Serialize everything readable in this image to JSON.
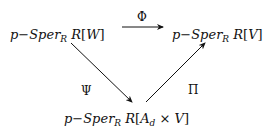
{
  "diagram": {
    "type": "commutative-diagram",
    "nodes": {
      "top_left": {
        "prefix": "p−Sper",
        "sub": "R",
        "ring": "R",
        "open": "[",
        "var": "W",
        "close": "]"
      },
      "top_right": {
        "prefix": "p−Sper",
        "sub": "R",
        "ring": "R",
        "open": "[",
        "var": "V",
        "close": "]"
      },
      "bottom": {
        "prefix": "p−Sper",
        "sub": "R",
        "ring": "R",
        "open": "[",
        "var_a": "A",
        "var_a_sub": "d",
        "times": " × ",
        "var_b": "V",
        "close": "]"
      }
    },
    "arrows": [
      {
        "from": "top_left",
        "to": "top_right",
        "label": "Φ"
      },
      {
        "from": "top_left",
        "to": "bottom",
        "label": "Ψ"
      },
      {
        "from": "bottom",
        "to": "top_right",
        "label": "Π"
      }
    ],
    "labels": {
      "phi": "Φ",
      "psi": "Ψ",
      "pi": "Π"
    }
  }
}
